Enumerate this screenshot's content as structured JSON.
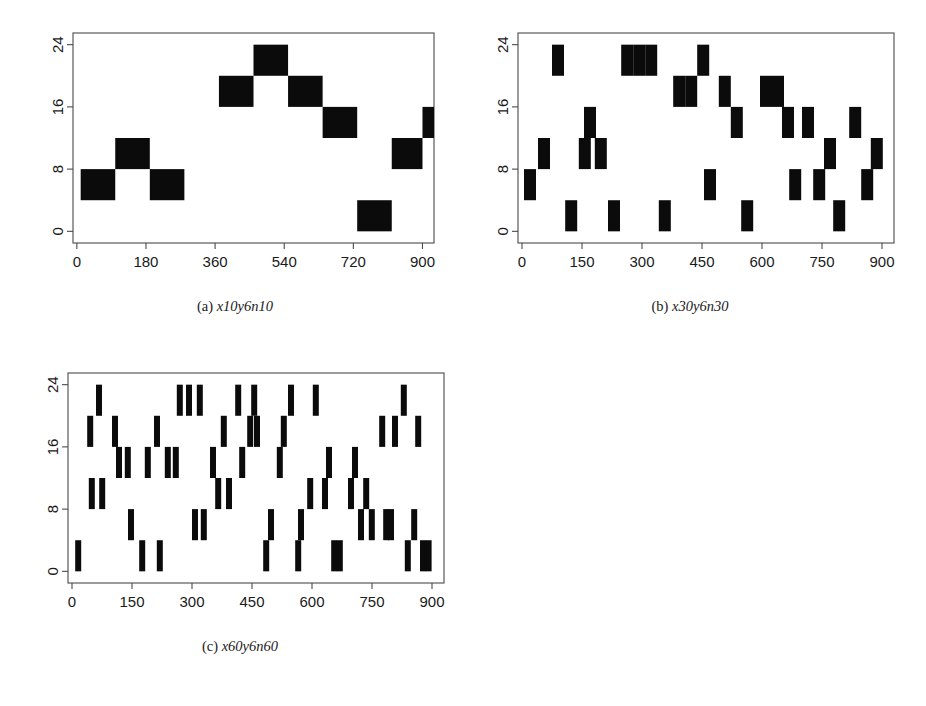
{
  "figure": {
    "background_color": "#ffffff",
    "block_color": "#0b0b0b",
    "axis_color": "#4a4a4a",
    "panels": [
      {
        "id": "a",
        "caption_index": "(a)",
        "caption_name": "x10y6n10"
      },
      {
        "id": "b",
        "caption_index": "(b)",
        "caption_name": "x30y6n30"
      },
      {
        "id": "c",
        "caption_index": "(c)",
        "caption_name": "x60y6n60"
      }
    ]
  },
  "chart_data": [
    {
      "type": "bar",
      "panel": "a",
      "title": "x10y6n10",
      "xlabel": "",
      "ylabel": "",
      "xlim": [
        -10,
        930
      ],
      "ylim": [
        -1.5,
        25.5
      ],
      "grid": false,
      "legend": null,
      "xticks": [
        0,
        180,
        360,
        540,
        720,
        900
      ],
      "yticks": [
        0,
        8,
        16,
        24
      ],
      "block_width": 90,
      "block_height": 4,
      "blocks": [
        {
          "x0": 10,
          "x1": 100,
          "y0": 4,
          "y1": 8
        },
        {
          "x0": 100,
          "x1": 190,
          "y0": 8,
          "y1": 12
        },
        {
          "x0": 190,
          "x1": 280,
          "y0": 4,
          "y1": 8
        },
        {
          "x0": 370,
          "x1": 460,
          "y0": 16,
          "y1": 20
        },
        {
          "x0": 460,
          "x1": 550,
          "y0": 20,
          "y1": 24
        },
        {
          "x0": 550,
          "x1": 640,
          "y0": 16,
          "y1": 20
        },
        {
          "x0": 640,
          "x1": 730,
          "y0": 12,
          "y1": 16
        },
        {
          "x0": 730,
          "x1": 820,
          "y0": 0,
          "y1": 4
        },
        {
          "x0": 820,
          "x1": 900,
          "y0": 8,
          "y1": 12
        },
        {
          "x0": 900,
          "x1": 990,
          "y0": 12,
          "y1": 16
        }
      ]
    },
    {
      "type": "bar",
      "panel": "b",
      "title": "x30y6n30",
      "xlabel": "",
      "ylabel": "",
      "xlim": [
        -10,
        930
      ],
      "ylim": [
        -1.5,
        25.5
      ],
      "grid": false,
      "legend": null,
      "xticks": [
        0,
        150,
        300,
        450,
        600,
        750,
        900
      ],
      "yticks": [
        0,
        8,
        16,
        24
      ],
      "block_width": 30,
      "block_height": 4,
      "blocks": [
        {
          "x0": 5,
          "x1": 35,
          "y0": 4,
          "y1": 8
        },
        {
          "x0": 40,
          "x1": 70,
          "y0": 8,
          "y1": 12
        },
        {
          "x0": 75,
          "x1": 105,
          "y0": 20,
          "y1": 24
        },
        {
          "x0": 108,
          "x1": 138,
          "y0": 0,
          "y1": 4
        },
        {
          "x0": 142,
          "x1": 172,
          "y0": 8,
          "y1": 12
        },
        {
          "x0": 155,
          "x1": 185,
          "y0": 12,
          "y1": 16
        },
        {
          "x0": 182,
          "x1": 212,
          "y0": 8,
          "y1": 12
        },
        {
          "x0": 215,
          "x1": 245,
          "y0": 0,
          "y1": 4
        },
        {
          "x0": 248,
          "x1": 278,
          "y0": 20,
          "y1": 24
        },
        {
          "x0": 278,
          "x1": 308,
          "y0": 20,
          "y1": 24
        },
        {
          "x0": 308,
          "x1": 338,
          "y0": 20,
          "y1": 24
        },
        {
          "x0": 342,
          "x1": 372,
          "y0": 0,
          "y1": 4
        },
        {
          "x0": 378,
          "x1": 408,
          "y0": 16,
          "y1": 20
        },
        {
          "x0": 408,
          "x1": 438,
          "y0": 16,
          "y1": 20
        },
        {
          "x0": 438,
          "x1": 468,
          "y0": 20,
          "y1": 24
        },
        {
          "x0": 455,
          "x1": 485,
          "y0": 4,
          "y1": 8
        },
        {
          "x0": 492,
          "x1": 522,
          "y0": 16,
          "y1": 20
        },
        {
          "x0": 522,
          "x1": 552,
          "y0": 12,
          "y1": 16
        },
        {
          "x0": 548,
          "x1": 578,
          "y0": 0,
          "y1": 4
        },
        {
          "x0": 595,
          "x1": 625,
          "y0": 16,
          "y1": 20
        },
        {
          "x0": 625,
          "x1": 655,
          "y0": 16,
          "y1": 20
        },
        {
          "x0": 650,
          "x1": 680,
          "y0": 12,
          "y1": 16
        },
        {
          "x0": 668,
          "x1": 698,
          "y0": 4,
          "y1": 8
        },
        {
          "x0": 700,
          "x1": 730,
          "y0": 12,
          "y1": 16
        },
        {
          "x0": 728,
          "x1": 758,
          "y0": 4,
          "y1": 8
        },
        {
          "x0": 755,
          "x1": 785,
          "y0": 8,
          "y1": 12
        },
        {
          "x0": 778,
          "x1": 808,
          "y0": 0,
          "y1": 4
        },
        {
          "x0": 818,
          "x1": 848,
          "y0": 12,
          "y1": 16
        },
        {
          "x0": 848,
          "x1": 878,
          "y0": 4,
          "y1": 8
        },
        {
          "x0": 872,
          "x1": 902,
          "y0": 8,
          "y1": 12
        }
      ]
    },
    {
      "type": "bar",
      "panel": "c",
      "title": "x60y6n60",
      "xlabel": "",
      "ylabel": "",
      "xlim": [
        -10,
        930
      ],
      "ylim": [
        -1.5,
        25.5
      ],
      "grid": false,
      "legend": null,
      "xticks": [
        0,
        150,
        300,
        450,
        600,
        750,
        900
      ],
      "yticks": [
        0,
        8,
        16,
        24
      ],
      "block_width": 15,
      "block_height": 4,
      "blocks": [
        {
          "x0": 8,
          "x1": 23,
          "y0": 0,
          "y1": 4
        },
        {
          "x0": 38,
          "x1": 53,
          "y0": 16,
          "y1": 20
        },
        {
          "x0": 42,
          "x1": 57,
          "y0": 8,
          "y1": 12
        },
        {
          "x0": 60,
          "x1": 75,
          "y0": 20,
          "y1": 24
        },
        {
          "x0": 68,
          "x1": 83,
          "y0": 8,
          "y1": 12
        },
        {
          "x0": 100,
          "x1": 115,
          "y0": 16,
          "y1": 20
        },
        {
          "x0": 110,
          "x1": 125,
          "y0": 12,
          "y1": 16
        },
        {
          "x0": 132,
          "x1": 147,
          "y0": 12,
          "y1": 16
        },
        {
          "x0": 140,
          "x1": 155,
          "y0": 4,
          "y1": 8
        },
        {
          "x0": 168,
          "x1": 183,
          "y0": 0,
          "y1": 4
        },
        {
          "x0": 182,
          "x1": 197,
          "y0": 12,
          "y1": 16
        },
        {
          "x0": 205,
          "x1": 220,
          "y0": 16,
          "y1": 20
        },
        {
          "x0": 212,
          "x1": 227,
          "y0": 0,
          "y1": 4
        },
        {
          "x0": 232,
          "x1": 247,
          "y0": 12,
          "y1": 16
        },
        {
          "x0": 252,
          "x1": 267,
          "y0": 12,
          "y1": 16
        },
        {
          "x0": 262,
          "x1": 277,
          "y0": 20,
          "y1": 24
        },
        {
          "x0": 285,
          "x1": 300,
          "y0": 20,
          "y1": 24
        },
        {
          "x0": 300,
          "x1": 315,
          "y0": 4,
          "y1": 8
        },
        {
          "x0": 312,
          "x1": 327,
          "y0": 20,
          "y1": 24
        },
        {
          "x0": 322,
          "x1": 337,
          "y0": 4,
          "y1": 8
        },
        {
          "x0": 345,
          "x1": 360,
          "y0": 12,
          "y1": 16
        },
        {
          "x0": 358,
          "x1": 373,
          "y0": 8,
          "y1": 12
        },
        {
          "x0": 372,
          "x1": 387,
          "y0": 16,
          "y1": 20
        },
        {
          "x0": 385,
          "x1": 400,
          "y0": 8,
          "y1": 12
        },
        {
          "x0": 408,
          "x1": 423,
          "y0": 20,
          "y1": 24
        },
        {
          "x0": 418,
          "x1": 433,
          "y0": 12,
          "y1": 16
        },
        {
          "x0": 438,
          "x1": 453,
          "y0": 16,
          "y1": 20
        },
        {
          "x0": 448,
          "x1": 463,
          "y0": 20,
          "y1": 24
        },
        {
          "x0": 455,
          "x1": 470,
          "y0": 16,
          "y1": 20
        },
        {
          "x0": 478,
          "x1": 493,
          "y0": 0,
          "y1": 4
        },
        {
          "x0": 490,
          "x1": 505,
          "y0": 4,
          "y1": 8
        },
        {
          "x0": 512,
          "x1": 527,
          "y0": 12,
          "y1": 16
        },
        {
          "x0": 522,
          "x1": 537,
          "y0": 16,
          "y1": 20
        },
        {
          "x0": 540,
          "x1": 555,
          "y0": 20,
          "y1": 24
        },
        {
          "x0": 558,
          "x1": 573,
          "y0": 0,
          "y1": 4
        },
        {
          "x0": 565,
          "x1": 580,
          "y0": 4,
          "y1": 8
        },
        {
          "x0": 588,
          "x1": 603,
          "y0": 8,
          "y1": 12
        },
        {
          "x0": 602,
          "x1": 617,
          "y0": 20,
          "y1": 24
        },
        {
          "x0": 625,
          "x1": 640,
          "y0": 8,
          "y1": 12
        },
        {
          "x0": 635,
          "x1": 650,
          "y0": 12,
          "y1": 16
        },
        {
          "x0": 648,
          "x1": 663,
          "y0": 0,
          "y1": 4
        },
        {
          "x0": 662,
          "x1": 677,
          "y0": 0,
          "y1": 4
        },
        {
          "x0": 690,
          "x1": 705,
          "y0": 8,
          "y1": 12
        },
        {
          "x0": 700,
          "x1": 715,
          "y0": 12,
          "y1": 16
        },
        {
          "x0": 715,
          "x1": 730,
          "y0": 4,
          "y1": 8
        },
        {
          "x0": 728,
          "x1": 743,
          "y0": 8,
          "y1": 12
        },
        {
          "x0": 742,
          "x1": 757,
          "y0": 4,
          "y1": 8
        },
        {
          "x0": 768,
          "x1": 783,
          "y0": 16,
          "y1": 20
        },
        {
          "x0": 778,
          "x1": 793,
          "y0": 4,
          "y1": 8
        },
        {
          "x0": 790,
          "x1": 805,
          "y0": 4,
          "y1": 8
        },
        {
          "x0": 800,
          "x1": 815,
          "y0": 16,
          "y1": 20
        },
        {
          "x0": 822,
          "x1": 837,
          "y0": 20,
          "y1": 24
        },
        {
          "x0": 832,
          "x1": 847,
          "y0": 0,
          "y1": 4
        },
        {
          "x0": 848,
          "x1": 863,
          "y0": 4,
          "y1": 8
        },
        {
          "x0": 858,
          "x1": 873,
          "y0": 16,
          "y1": 20
        },
        {
          "x0": 870,
          "x1": 885,
          "y0": 0,
          "y1": 4
        },
        {
          "x0": 884,
          "x1": 899,
          "y0": 0,
          "y1": 4
        }
      ]
    }
  ]
}
